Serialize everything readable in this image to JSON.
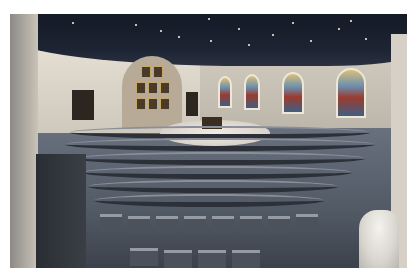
{
  "image": {
    "description": "Wide-angle interior photograph of a church sanctuary with a dark star-speckled ceiling, stained glass windows along the right wall, an arched niche with framed icons on the left, a round raised altar platform at center, and curved rows of chairs on a gray carpet; a white statue stands in the lower right foreground.",
    "elements": {
      "ceiling": "dark ceiling with small star lights",
      "stained_glass_windows": 4,
      "icon_niche_frames": 9,
      "altar": "central round platform with altar table",
      "seating": "curved rows of chairs",
      "statue": "white statue in lower right"
    },
    "colors": {
      "ceiling": "#1d2433",
      "walls": "#d6d0c6",
      "carpet": "#525a66",
      "platform": "#e8e4dc",
      "chairs": "#4c525b",
      "glass_gold": "#d9c07a",
      "glass_blue": "#6b8fb0",
      "glass_red": "#9b3b2f"
    }
  }
}
